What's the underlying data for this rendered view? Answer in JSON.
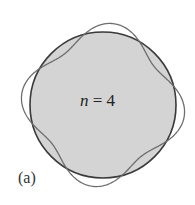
{
  "figure": {
    "panel_label": "(a)",
    "mode_label": {
      "variable": "n",
      "equals": " = ",
      "value": "4"
    },
    "circle": {
      "cx": 103,
      "cy": 105,
      "r": 73,
      "fill": "#d4d4d4",
      "stroke": "#3a3a3a"
    },
    "standing_wave": {
      "n": 4,
      "amplitude": 9,
      "phase_deg": 60,
      "stroke": "#6e6e6e"
    }
  }
}
